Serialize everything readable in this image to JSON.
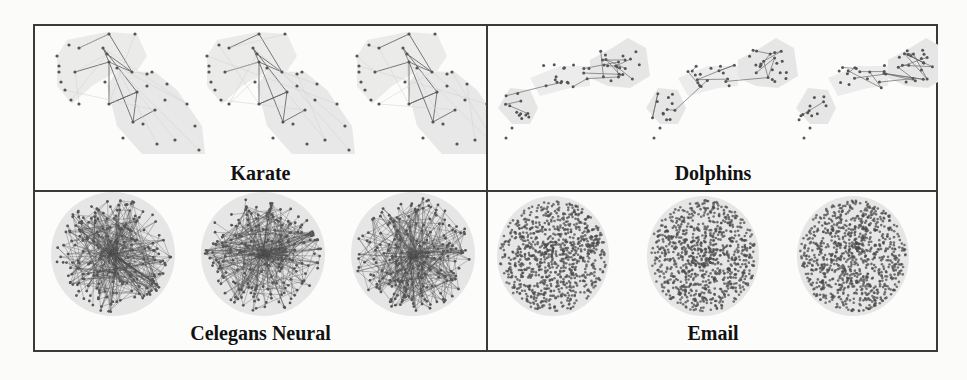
{
  "figure": {
    "panels": [
      {
        "id": "karate",
        "label": "Karate",
        "layouts": 3
      },
      {
        "id": "dolphins",
        "label": "Dolphins",
        "layouts": 3
      },
      {
        "id": "celegans",
        "label": "Celegans Neural",
        "layouts": 3
      },
      {
        "id": "email",
        "label": "Email",
        "layouts": 3
      }
    ],
    "colors": {
      "border": "#3a3a3a",
      "hull_fill": "#e6e6e6",
      "node": "#555555",
      "edge": "#6a6a6a",
      "dense": "#4a4a4a"
    }
  }
}
